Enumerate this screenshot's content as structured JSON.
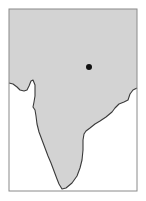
{
  "map": {
    "region": "Indian subcontinent",
    "colors": {
      "background": "#ffffff",
      "land": "#d3d3d3",
      "coastline": "#3a3a3a",
      "frame": "#8a8a8a",
      "marker": "#111111"
    },
    "frame": {
      "x": 9,
      "y": 9,
      "width": 128,
      "height": 182
    },
    "marker": {
      "cx": 89,
      "cy": 67,
      "r": 3,
      "label": ""
    }
  }
}
